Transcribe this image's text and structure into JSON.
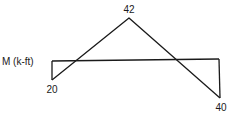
{
  "diagram": {
    "type": "bending-moment-diagram",
    "axis_label": "M (k-ft)",
    "values": {
      "left_end": "20",
      "peak": "42",
      "right_end": "40"
    },
    "points": {
      "baseline_left": [
        52,
        61
      ],
      "baseline_right": [
        219,
        59
      ],
      "left_bottom": [
        52,
        80
      ],
      "peak": [
        129,
        18
      ],
      "right_bottom": [
        220,
        98
      ]
    },
    "stroke_color": "#1a1a1a"
  }
}
